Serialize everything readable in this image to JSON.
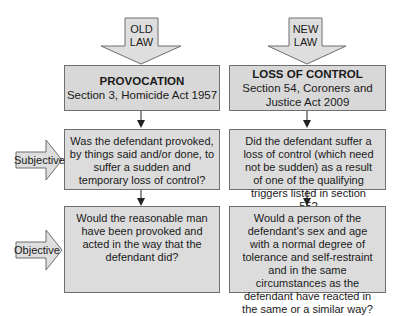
{
  "arrows": {
    "old_law": [
      "OLD",
      "LAW"
    ],
    "new_law": [
      "NEW",
      "LAW"
    ]
  },
  "old_law": {
    "title": "PROVOCATION",
    "subtitle": "Section 3, Homicide Act 1957",
    "subjective_question": "Was the defendant provoked, by things said and/or done, to suffer a sudden and temporary loss of control?",
    "objective_question": "Would the reasonable man have been provoked and acted in the way that the defendant did?"
  },
  "new_law": {
    "title": "LOSS OF CONTROL",
    "subtitle": "Section 54, Coroners and Justice Act 2009",
    "subjective_question": "Did the defendant suffer a loss of control (which need not be sudden) as a result of one of the qualifying triggers listed in section 55?",
    "objective_question": "Would a person of the defendant's sex and age with a normal degree of tolerance and self-restraint and in the same circumstances as the defendant have reacted in the same or a similar way?"
  },
  "side_labels": {
    "subjective": "Subjective",
    "objective": "Objective"
  }
}
